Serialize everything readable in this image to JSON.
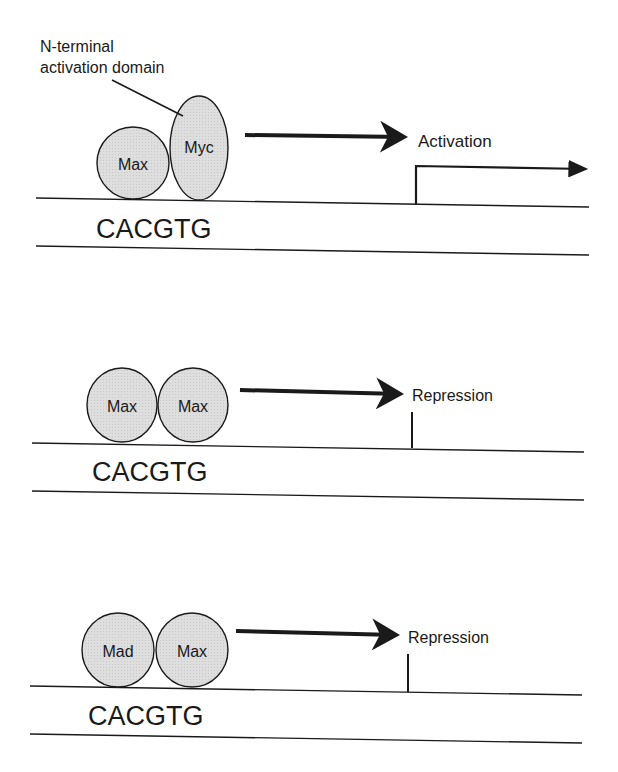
{
  "colors": {
    "protein_fill": "#dcdcdc",
    "stroke": "#1a1a1a",
    "background": "#ffffff"
  },
  "panels": [
    {
      "proteins": [
        {
          "label": "Max",
          "cx": 133,
          "cy": 163,
          "rx": 36,
          "ry": 36
        },
        {
          "label": "Myc",
          "cx": 199,
          "cy": 148,
          "rx": 29,
          "ry": 52
        }
      ],
      "annotation": {
        "line1": "N-terminal",
        "line2": "activation domain"
      },
      "sequence": "CACGTG",
      "outcome": "Activation",
      "transcription_arrow": true
    },
    {
      "proteins": [
        {
          "label": "Max",
          "cx": 122,
          "cy": 405,
          "rx": 35,
          "ry": 37
        },
        {
          "label": "Max",
          "cx": 193,
          "cy": 405,
          "rx": 35,
          "ry": 37
        }
      ],
      "sequence": "CACGTG",
      "outcome": "Repression",
      "transcription_arrow": false
    },
    {
      "proteins": [
        {
          "label": "Mad",
          "cx": 118,
          "cy": 650,
          "rx": 36,
          "ry": 37
        },
        {
          "label": "Max",
          "cx": 192,
          "cy": 650,
          "rx": 36,
          "ry": 37
        }
      ],
      "sequence": "CACGTG",
      "outcome": "Repression",
      "transcription_arrow": false
    }
  ]
}
